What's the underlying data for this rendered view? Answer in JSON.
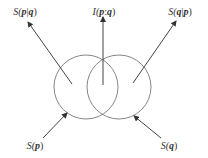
{
  "diagram": {
    "type": "venn-information-diagram",
    "colors": {
      "stroke": "#555555",
      "text": "#333333",
      "background": "#ffffff"
    },
    "circles": [
      {
        "name": "circle-p",
        "cx": 86,
        "cy": 87,
        "r": 32
      },
      {
        "name": "circle-q",
        "cx": 119,
        "cy": 87,
        "r": 32
      }
    ],
    "arrows": [
      {
        "name": "arrow-conditional-entropy-p-given-q",
        "x1": 72,
        "y1": 84,
        "x2": 28,
        "y2": 22
      },
      {
        "name": "arrow-mutual-information",
        "x1": 103,
        "y1": 85,
        "x2": 103,
        "y2": 17
      },
      {
        "name": "arrow-conditional-entropy-q-given-p",
        "x1": 133,
        "y1": 83,
        "x2": 176,
        "y2": 21
      },
      {
        "name": "arrow-entropy-p",
        "x1": 43,
        "y1": 138,
        "x2": 67,
        "y2": 113
      },
      {
        "name": "arrow-entropy-q",
        "x1": 161,
        "y1": 138,
        "x2": 134,
        "y2": 116
      }
    ],
    "labels": {
      "s_p_given_q": {
        "prefix": "S(",
        "a": "p",
        "sep": "|",
        "b": "q",
        "suffix": ")",
        "x": 25,
        "y": 12
      },
      "i_p_q": {
        "prefix": "I(",
        "a": "p",
        "sep": ":",
        "b": "q",
        "suffix": ")",
        "x": 104,
        "y": 12
      },
      "s_q_given_p": {
        "prefix": "S(",
        "a": "q",
        "sep": "|",
        "b": "p",
        "suffix": ")",
        "x": 180,
        "y": 12
      },
      "s_p": {
        "prefix": "S(",
        "a": "p",
        "suffix": ")",
        "x": 35,
        "y": 146
      },
      "s_q": {
        "prefix": "S(",
        "a": "q",
        "suffix": ")",
        "x": 169,
        "y": 146
      }
    }
  }
}
